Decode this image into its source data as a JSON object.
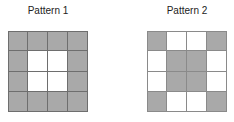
{
  "colors": {
    "filled": "#a9a9a9",
    "empty": "#ffffff",
    "grid_line": "#6e6e6e"
  },
  "patterns": [
    {
      "title": "Pattern 1",
      "rows": 4,
      "cols": 4,
      "cells": [
        [
          1,
          1,
          1,
          1
        ],
        [
          1,
          0,
          0,
          1
        ],
        [
          1,
          0,
          0,
          1
        ],
        [
          1,
          1,
          1,
          1
        ]
      ]
    },
    {
      "title": "Pattern 2",
      "rows": 4,
      "cols": 4,
      "cells": [
        [
          1,
          0,
          0,
          1
        ],
        [
          0,
          1,
          1,
          0
        ],
        [
          0,
          1,
          1,
          0
        ],
        [
          1,
          0,
          0,
          1
        ]
      ]
    }
  ]
}
